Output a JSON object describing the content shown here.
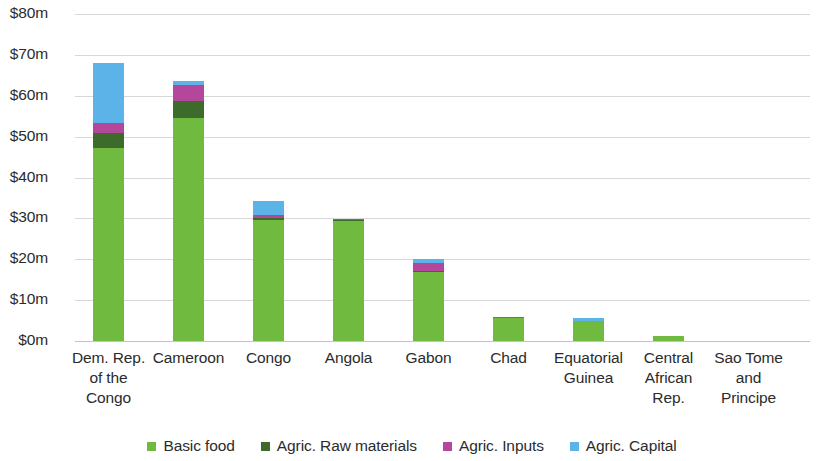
{
  "chart_data": {
    "type": "bar",
    "subtype": "stacked-bar",
    "title": "",
    "xlabel": "",
    "ylabel": "",
    "ylim": [
      0,
      80
    ],
    "y_unit": "$m",
    "grid": true,
    "legend_position": "bottom",
    "y_ticks": [
      0,
      10,
      20,
      30,
      40,
      50,
      60,
      70,
      80
    ],
    "y_tick_labels": [
      "$0m",
      "$10m",
      "$20m",
      "$30m",
      "$40m",
      "$50m",
      "$60m",
      "$70m",
      "$80m"
    ],
    "categories": [
      "Dem. Rep. of the Congo",
      "Cameroon",
      "Congo",
      "Angola",
      "Gabon",
      "Chad",
      "Equatorial Guinea",
      "Central African Rep.",
      "Sao Tome and Principe"
    ],
    "category_lines": [
      [
        "Dem. Rep.",
        "of the",
        "Congo"
      ],
      [
        "Cameroon"
      ],
      [
        "Congo"
      ],
      [
        "Angola"
      ],
      [
        "Gabon"
      ],
      [
        "Chad"
      ],
      [
        "Equatorial",
        "Guinea"
      ],
      [
        "Central",
        "African",
        "Rep."
      ],
      [
        "Sao Tome",
        "and",
        "Principe"
      ]
    ],
    "series": [
      {
        "name": "Basic food",
        "color": "#70ba40",
        "values": [
          47.2,
          54.5,
          29.6,
          29.4,
          16.9,
          5.6,
          4.8,
          1.3,
          0.0
        ]
      },
      {
        "name": "Agric. Raw materials",
        "color": "#3c6b2c",
        "values": [
          3.7,
          4.2,
          0.5,
          0.1,
          0.3,
          0.1,
          0.1,
          0.0,
          0.0
        ]
      },
      {
        "name": "Agric. Inputs",
        "color": "#b4479b",
        "values": [
          2.4,
          3.9,
          0.8,
          0.4,
          2.0,
          0.1,
          0.1,
          0.0,
          0.0
        ]
      },
      {
        "name": "Agric. Capital",
        "color": "#5cb3e8",
        "values": [
          14.7,
          1.1,
          3.3,
          0.0,
          0.8,
          0.1,
          0.6,
          0.0,
          0.0
        ]
      }
    ],
    "totals": [
      68.0,
      63.7,
      34.2,
      29.9,
      20.0,
      5.9,
      5.6,
      1.3,
      0.0
    ]
  },
  "legend": {
    "items": [
      {
        "label": "Basic food",
        "color": "#70ba40"
      },
      {
        "label": "Agric. Raw materials",
        "color": "#3c6b2c"
      },
      {
        "label": "Agric. Inputs",
        "color": "#b4479b"
      },
      {
        "label": "Agric. Capital",
        "color": "#5cb3e8"
      }
    ]
  },
  "style": {
    "gridline_color": "#d8d8d8",
    "text_color": "#2b2b2b",
    "background": "#ffffff"
  }
}
